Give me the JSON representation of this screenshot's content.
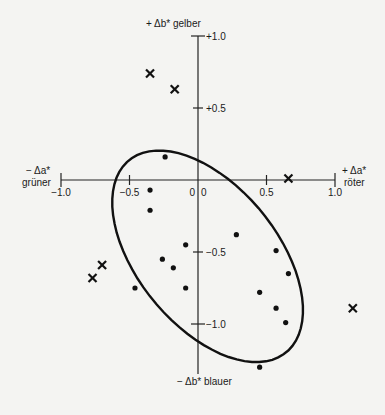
{
  "chart_data": {
    "type": "scatter",
    "title": "",
    "xlabel_pos": "+ Δa*",
    "xlabel_pos_word": "röter",
    "xlabel_neg": "− Δa*",
    "xlabel_neg_word": "grüner",
    "ylabel_pos": "+ Δb* gelber",
    "ylabel_neg": "− Δb* blauer",
    "xlim": [
      -1.0,
      1.0
    ],
    "ylim": [
      -1.0,
      1.0
    ],
    "x_ticks": [
      {
        "value": -1.0,
        "label": "−1.0"
      },
      {
        "value": -0.5,
        "label": "−0.5"
      },
      {
        "value": 0.0,
        "label": "0"
      },
      {
        "value": 0.5,
        "label": "0.5"
      },
      {
        "value": 1.0,
        "label": "1.0"
      }
    ],
    "y_ticks": [
      {
        "value": 1.0,
        "label": "+1.0"
      },
      {
        "value": 0.5,
        "label": "+0.5"
      },
      {
        "value": 0.0,
        "label": "0"
      },
      {
        "value": -0.5,
        "label": "−0.5"
      },
      {
        "value": -1.0,
        "label": "−1.0"
      }
    ],
    "grid": false,
    "series": [
      {
        "name": "accepted",
        "marker": "dot",
        "points": [
          [
            -0.24,
            0.16
          ],
          [
            -0.35,
            -0.07
          ],
          [
            -0.35,
            -0.21
          ],
          [
            -0.09,
            -0.45
          ],
          [
            0.28,
            -0.38
          ],
          [
            -0.26,
            -0.55
          ],
          [
            -0.18,
            -0.61
          ],
          [
            -0.46,
            -0.75
          ],
          [
            -0.09,
            -0.75
          ],
          [
            0.57,
            -0.49
          ],
          [
            0.66,
            -0.65
          ],
          [
            0.45,
            -0.78
          ],
          [
            0.57,
            -0.89
          ],
          [
            0.64,
            -0.99
          ],
          [
            0.45,
            -1.3
          ]
        ]
      },
      {
        "name": "rejected",
        "marker": "cross",
        "points": [
          [
            -0.35,
            0.74
          ],
          [
            -0.17,
            0.63
          ],
          [
            0.66,
            0.01
          ],
          [
            -0.7,
            -0.59
          ],
          [
            -0.77,
            -0.68
          ],
          [
            1.13,
            -0.89
          ]
        ]
      }
    ],
    "tolerance_ellipse": {
      "center": [
        0.07,
        -0.53
      ],
      "semi_axis_major": 0.88,
      "semi_axis_minor": 0.5,
      "rotation_deg": 48
    }
  }
}
